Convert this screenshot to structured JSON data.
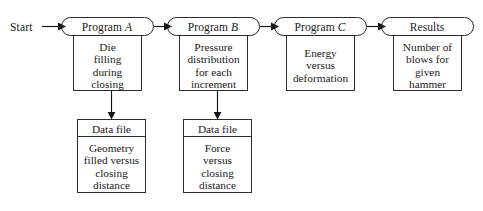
{
  "diagram": {
    "start_label": "Start",
    "stroke_color": "#2b2b2b",
    "fill_color": "#ffffff",
    "arrow_color": "#151515",
    "columns": [
      {
        "id": "program-a",
        "header": "Program A",
        "header_plain": "Program",
        "header_italic": "A",
        "body_lines": [
          "Die",
          "filling",
          "during",
          "closing"
        ],
        "body_text": "Die filling during closing",
        "has_data_file": true,
        "data_file": {
          "header": "Data file",
          "body_lines": [
            "Geometry",
            "filled versus",
            "closing",
            "distance"
          ],
          "body_text": "Geometry filled versus closing distance"
        }
      },
      {
        "id": "program-b",
        "header": "Program B",
        "header_plain": "Program",
        "header_italic": "B",
        "body_lines": [
          "Pressure",
          "distribution",
          "for each",
          "increment"
        ],
        "body_text": "Pressure distribution for each increment",
        "has_data_file": true,
        "data_file": {
          "header": "Data file",
          "body_lines": [
            "Force",
            "versus",
            "closing",
            "distance"
          ],
          "body_text": "Force versus closing distance"
        }
      },
      {
        "id": "program-c",
        "header": "Program C",
        "header_plain": "Program",
        "header_italic": "C",
        "body_lines": [
          "Energy",
          "versus",
          "deformation"
        ],
        "body_text": "Energy versus deformation",
        "has_data_file": false
      },
      {
        "id": "results",
        "header": "Results",
        "header_plain": "Results",
        "header_italic": "",
        "body_lines": [
          "Number of",
          "blows for",
          "given",
          "hammer"
        ],
        "body_text": "Number of blows for given hammer",
        "has_data_file": false
      }
    ],
    "connections": [
      {
        "id": "start-to-a",
        "from": "start",
        "to": "program-a",
        "direction": "right"
      },
      {
        "id": "a-to-b",
        "from": "program-a",
        "to": "program-b",
        "direction": "right"
      },
      {
        "id": "b-to-c",
        "from": "program-b",
        "to": "program-c",
        "direction": "right"
      },
      {
        "id": "c-to-results",
        "from": "program-c",
        "to": "results",
        "direction": "right"
      },
      {
        "id": "a-to-datafile-1",
        "from": "program-a",
        "to": "data-file-1",
        "direction": "down"
      },
      {
        "id": "b-to-datafile-2",
        "from": "program-b",
        "to": "data-file-2",
        "direction": "down"
      }
    ]
  }
}
